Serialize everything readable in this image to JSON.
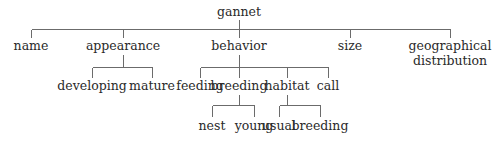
{
  "diagram": {
    "type": "tree",
    "line_color": "#6b6b6b",
    "text_color": "#2a2a2a",
    "root": {
      "label": "gannet",
      "children": [
        {
          "label": "name"
        },
        {
          "label": "appearance",
          "children": [
            {
              "label": "developing"
            },
            {
              "label": "mature"
            }
          ]
        },
        {
          "label": "behavior",
          "children": [
            {
              "label": "feeding"
            },
            {
              "label": "breeding",
              "children": [
                {
                  "label": "nest"
                },
                {
                  "label": "young"
                }
              ]
            },
            {
              "label": "habitat",
              "children": [
                {
                  "label": "usual"
                },
                {
                  "label": "breeding"
                }
              ]
            },
            {
              "label": "call"
            }
          ]
        },
        {
          "label": "size"
        },
        {
          "label": "geographical distribution",
          "lines": [
            "geographical",
            "distribution"
          ]
        }
      ]
    }
  },
  "labels": {
    "root": "gannet",
    "name": "name",
    "appearance": "appearance",
    "behavior": "behavior",
    "size": "size",
    "geo_line1": "geographical",
    "geo_line2": "distribution",
    "developing": "developing",
    "mature": "mature",
    "feeding": "feeding",
    "breeding": "breeding",
    "habitat": "habitat",
    "call": "call",
    "nest": "nest",
    "young": "young",
    "usual": "usual",
    "habitat_breeding": "breeding"
  }
}
